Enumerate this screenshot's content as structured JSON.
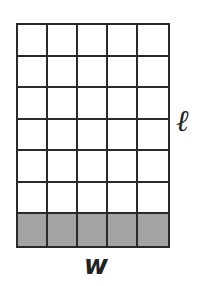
{
  "diagram": {
    "type": "area-grid",
    "rows": 7,
    "columns": 5,
    "shaded_rows": [
      6
    ],
    "shaded_color": "#a3a3a3",
    "line_color": "#2a2a2a",
    "labels": {
      "length": "ℓ",
      "width": "w"
    }
  }
}
